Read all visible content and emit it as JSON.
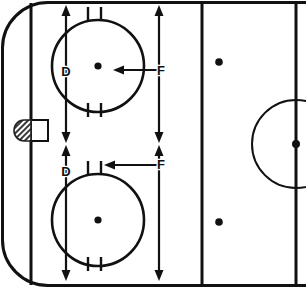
{
  "diagram": {
    "sport": "ice-hockey",
    "view": "defensive-zone-half-rink",
    "colors": {
      "line": "#111111",
      "ice": "#ffffff",
      "net": "#444444"
    },
    "rink": {
      "width": 306,
      "height": 288,
      "corner_radius": 46,
      "boards_stroke_width": 3
    },
    "labels": [
      {
        "id": "d-top",
        "text": "D",
        "x": 66,
        "y": 72
      },
      {
        "id": "d-bottom",
        "text": "D",
        "x": 66,
        "y": 172
      },
      {
        "id": "f-top",
        "text": "F",
        "x": 160,
        "y": 72
      },
      {
        "id": "f-bottom",
        "text": "F",
        "x": 160,
        "y": 166
      }
    ],
    "legend": {
      "d_meaning": "D",
      "f_meaning": "F"
    },
    "lines": {
      "goal_line": {
        "id": "goal-line",
        "x": 31,
        "y1": 3,
        "y2": 285
      },
      "blue_line": {
        "id": "blue-line",
        "x": 202,
        "y1": 3,
        "y2": 285
      },
      "center_line": {
        "id": "center-line",
        "x": 296,
        "y1": 3,
        "y2": 285
      }
    },
    "goal": {
      "id": "goal-net",
      "crease_x": 31,
      "crease_y": 120,
      "crease_w": 17,
      "crease_h": 21,
      "net_cx": 24,
      "net_cy": 131,
      "net_rx": 10,
      "net_ry": 11
    },
    "faceoff_circles": [
      {
        "id": "faceoff-circle-top",
        "cx": 98,
        "cy": 66,
        "r": 46,
        "dot_r": 3.6
      },
      {
        "id": "faceoff-circle-bottom",
        "cx": 98,
        "cy": 220,
        "r": 46,
        "dot_r": 3.6
      }
    ],
    "faceoff_dots": [
      {
        "id": "neutral-dot-top",
        "cx": 219,
        "cy": 62,
        "r": 3.8
      },
      {
        "id": "neutral-dot-bottom",
        "cx": 219,
        "cy": 222,
        "r": 3.8
      }
    ],
    "center_circle": {
      "id": "center-circle",
      "cx": 296,
      "cy": 144,
      "r": 44
    },
    "center_dot": {
      "id": "center-dot",
      "cx": 296,
      "cy": 144,
      "r": 4
    },
    "hash_marks": [
      {
        "id": "hash-top-left",
        "x": 88,
        "y1": 7,
        "y2": 20
      },
      {
        "id": "hash-top-right",
        "x": 101,
        "y1": 7,
        "y2": 20
      },
      {
        "id": "hash-bottom-left",
        "x": 88,
        "y1": 104,
        "y2": 117
      },
      {
        "id": "hash-bottom-right",
        "x": 101,
        "y1": 104,
        "y2": 117
      },
      {
        "id": "hash-low-top-left",
        "x": 88,
        "y1": 161,
        "y2": 174
      },
      {
        "id": "hash-low-top-right",
        "x": 101,
        "y1": 161,
        "y2": 174
      },
      {
        "id": "hash-low-bot-left",
        "x": 88,
        "y1": 258,
        "y2": 271
      },
      {
        "id": "hash-low-bot-right",
        "x": 101,
        "y1": 258,
        "y2": 271
      }
    ],
    "arrows": [
      {
        "id": "d-arrow-top",
        "label": "D",
        "orientation": "vertical",
        "double_headed": true,
        "x": 66,
        "y1": 8,
        "y2": 140
      },
      {
        "id": "d-arrow-bottom",
        "label": "D",
        "orientation": "vertical",
        "double_headed": true,
        "x": 66,
        "y1": 146,
        "y2": 278
      },
      {
        "id": "f-arrow-top",
        "label": "F",
        "orientation": "vertical",
        "double_headed": true,
        "x": 159,
        "y1": 8,
        "y2": 140
      },
      {
        "id": "f-arrow-bottom",
        "label": "F",
        "orientation": "vertical",
        "double_headed": true,
        "x": 159,
        "y1": 146,
        "y2": 278
      },
      {
        "id": "f-pointer-top",
        "label": "F",
        "orientation": "horizontal-left",
        "double_headed": false,
        "y": 70,
        "x_from": 159,
        "x_to": 114
      },
      {
        "id": "f-pointer-bottom",
        "label": "F",
        "orientation": "horizontal-left",
        "double_headed": false,
        "y": 165,
        "x_from": 159,
        "x_to": 104
      }
    ]
  }
}
